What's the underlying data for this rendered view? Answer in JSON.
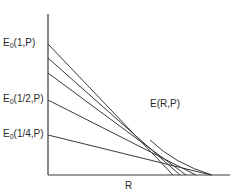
{
  "diagram": {
    "title": "",
    "y_labels": [
      {
        "base": "E",
        "sub": "0",
        "arg": "(1,P)"
      },
      {
        "base": "E",
        "sub": "0",
        "arg": "(1/2,P)"
      },
      {
        "base": "E",
        "sub": "0",
        "arg": "(1/4,P)"
      }
    ],
    "curve_label": "E(R,P)",
    "x_label": "R",
    "colors": {
      "line": "#3a3a3a",
      "background": "#ffffff"
    }
  }
}
